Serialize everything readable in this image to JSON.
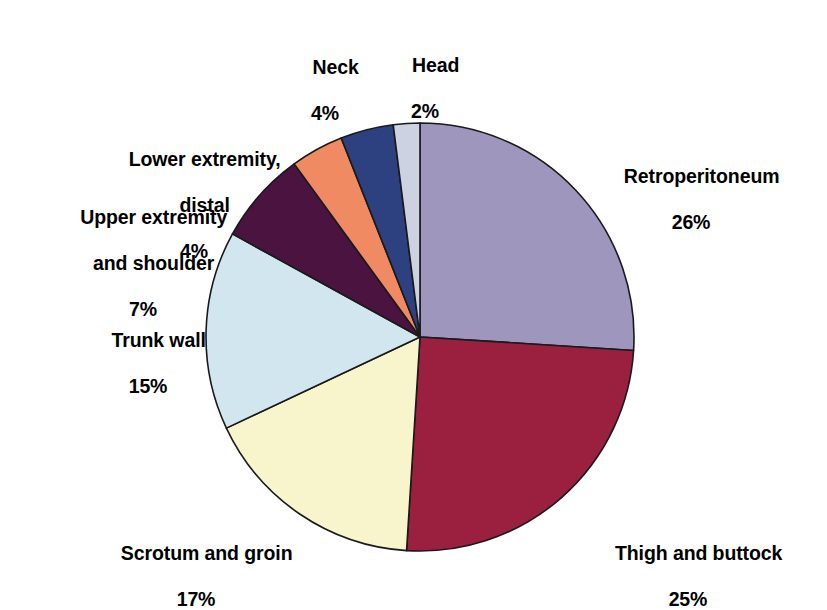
{
  "chart_data": {
    "type": "pie",
    "title": "",
    "subtitle": "",
    "xlabel": "",
    "ylabel": "",
    "legend_position": "none",
    "grid": false,
    "start_angle_deg": 0,
    "direction": "clockwise",
    "units": "percent",
    "categories": [
      "Retroperitoneum",
      "Thigh and buttock",
      "Scrotum and groin",
      "Trunk wall",
      "Upper extremity and shoulder",
      "Lower extremity, distal",
      "Neck",
      "Head"
    ],
    "values": [
      26,
      25,
      17,
      15,
      7,
      4,
      4,
      2
    ],
    "slices": [
      {
        "name": "Retroperitoneum",
        "label_line1": "Retroperitoneum",
        "label_pct": "26%",
        "value": 26,
        "color": "#9e96bd"
      },
      {
        "name": "Thigh and buttock",
        "label_line1": "Thigh and buttock",
        "label_pct": "25%",
        "value": 25,
        "color": "#9b2040"
      },
      {
        "name": "Scrotum and groin",
        "label_line1": "Scrotum and groin",
        "label_pct": "17%",
        "value": 17,
        "color": "#f8f5cd"
      },
      {
        "name": "Trunk wall",
        "label_line1": "Trunk wall",
        "label_pct": "15%",
        "value": 15,
        "color": "#d2e6ef"
      },
      {
        "name": "Upper extremity and shoulder",
        "label_line1": "Upper extremity",
        "label_line2": "and shoulder",
        "label_pct": "7%",
        "value": 7,
        "color": "#4a1340"
      },
      {
        "name": "Lower extremity, distal",
        "label_line1": "Lower extremity,",
        "label_line2": "distal",
        "label_pct": "4%",
        "value": 4,
        "color": "#ef8a62"
      },
      {
        "name": "Neck",
        "label_line1": "Neck",
        "label_pct": "4%",
        "value": 4,
        "color": "#2d4080"
      },
      {
        "name": "Head",
        "label_line1": "Head",
        "label_pct": "2%",
        "value": 2,
        "color": "#cdd2e2"
      }
    ]
  },
  "labels": {
    "retroperitoneum": {
      "name": "Retroperitoneum",
      "pct": "26%"
    },
    "thigh": {
      "name": "Thigh and buttock",
      "pct": "25%"
    },
    "scrotum": {
      "name": "Scrotum and groin",
      "pct": "17%"
    },
    "trunk": {
      "name": "Trunk wall",
      "pct": "15%"
    },
    "upper_extremity": {
      "line1": "Upper extremity",
      "line2": "and shoulder",
      "pct": "7%"
    },
    "lower_extremity": {
      "line1": "Lower extremity,",
      "line2": "distal",
      "pct": "4%"
    },
    "neck": {
      "name": "Neck",
      "pct": "4%"
    },
    "head": {
      "name": "Head",
      "pct": "2%"
    }
  },
  "geometry": {
    "center_x": 420,
    "center_y": 337,
    "radius": 214
  }
}
